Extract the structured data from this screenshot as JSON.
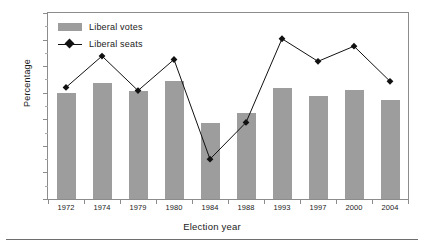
{
  "chart_data": {
    "type": "bar",
    "title": "",
    "xlabel": "Election year",
    "ylabel": "Percentage",
    "categories": [
      "1972",
      "1974",
      "1979",
      "1980",
      "1984",
      "1988",
      "1993",
      "1997",
      "2000",
      "2004"
    ],
    "series": [
      {
        "name": "Liberal votes",
        "render": "bar",
        "color": "#9d9d9d",
        "values": [
          39.8,
          43.5,
          40.5,
          44.5,
          28.5,
          32.5,
          41.8,
          38.8,
          41.0,
          37.3
        ]
      },
      {
        "name": "Liberal seats",
        "render": "line",
        "color": "#111111",
        "marker": "diamond",
        "values": [
          42.0,
          53.8,
          40.8,
          52.5,
          15.0,
          28.8,
          60.3,
          51.8,
          57.5,
          44.3
        ]
      }
    ],
    "ylim": [
      0,
      70
    ],
    "yticks": [
      0,
      10,
      20,
      30,
      40,
      50,
      60,
      70
    ],
    "yminorticks": [
      5,
      15,
      25,
      35,
      45,
      55,
      65
    ],
    "ytick_labels": [
      "0",
      "10",
      "20",
      "30",
      "40",
      "50",
      "60",
      "70"
    ],
    "grid": false,
    "legend_position": "top-left",
    "legend": [
      "Liberal votes",
      "Liberal seats"
    ]
  },
  "legend": {
    "votes_label": "Liberal votes",
    "seats_label": "Liberal seats"
  },
  "axes": {
    "x_title": "Election year",
    "y_title": "Percentage"
  }
}
